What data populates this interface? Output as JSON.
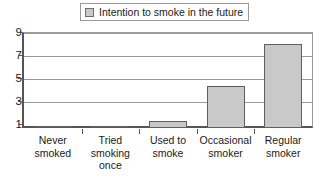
{
  "legend": {
    "swatch_icon": "legend-swatch-icon",
    "label": "Intention to smoke in the future",
    "swatch_color": "#c9c9c9",
    "border_color": "#9a9a9a"
  },
  "axis": {
    "y_ticks": [
      "1",
      "3",
      "5",
      "7",
      "9"
    ],
    "x_labels": [
      "Never\nsmoked",
      "Tried\nsmoking\nonce",
      "Used to\nsmoke",
      "Occasional\nsmoker",
      "Regular\nsmoker"
    ]
  },
  "chart_data": {
    "type": "bar",
    "title": "",
    "subtitle": "",
    "xlabel": "",
    "ylabel": "",
    "categories": [
      "Never smoked",
      "Tried smoking once",
      "Used to smoke",
      "Occasional smoker",
      "Regular smoker"
    ],
    "category_labels_multiline": [
      [
        "Never",
        "smoked"
      ],
      [
        "Tried",
        "smoking",
        "once"
      ],
      [
        "Used to",
        "smoke"
      ],
      [
        "Occasional",
        "smoker"
      ],
      [
        "Regular",
        "smoker"
      ]
    ],
    "series": [
      {
        "name": "Intention to smoke in the future",
        "values": [
          1.05,
          1.2,
          1.7,
          5,
          9
        ],
        "color": "#c9c9c9",
        "border_color": "#5e5e5e"
      }
    ],
    "ylim": [
      1,
      10
    ],
    "ytick_values": [
      1,
      3,
      5,
      7,
      9
    ],
    "grid": true,
    "grid_axis": "y",
    "legend_position": "top-center",
    "bar_fill": "#c9c9c9",
    "bar_border": "#5e5e5e",
    "background": "#ffffff"
  }
}
